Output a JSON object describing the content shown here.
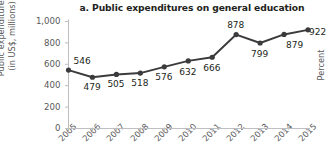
{
  "chart_data": {
    "type": "line",
    "title": "a. Public expenditures on general education",
    "xlabel": "",
    "ylabel": "Public expenditures\n(in US$, millions)",
    "ylabel_line1": "Public expenditures",
    "ylabel_line2": "(in US$, millions)",
    "right_axis_label": "Percent",
    "categories": [
      "2005",
      "2006",
      "2007",
      "2008",
      "2009",
      "2010",
      "2011",
      "2012",
      "2013",
      "2014",
      "2015"
    ],
    "values": [
      546,
      479,
      505,
      518,
      576,
      632,
      666,
      878,
      799,
      879,
      922
    ],
    "data_labels": [
      "546",
      "479",
      "505",
      "518",
      "576",
      "632",
      "666",
      "878",
      "799",
      "879",
      "922"
    ],
    "ylim": [
      0,
      1000
    ],
    "yticks": [
      0,
      200,
      400,
      600,
      800,
      1000
    ],
    "ytick_labels": [
      "0",
      "200",
      "400",
      "600",
      "800",
      "1,000"
    ],
    "grid": false,
    "legend": "none",
    "series_color": "#3b3b3d",
    "axis_color": "#bcbec0",
    "text_color": "#58585a",
    "title_color": "#231f20",
    "background": "#ffffff",
    "marker": "circle"
  }
}
